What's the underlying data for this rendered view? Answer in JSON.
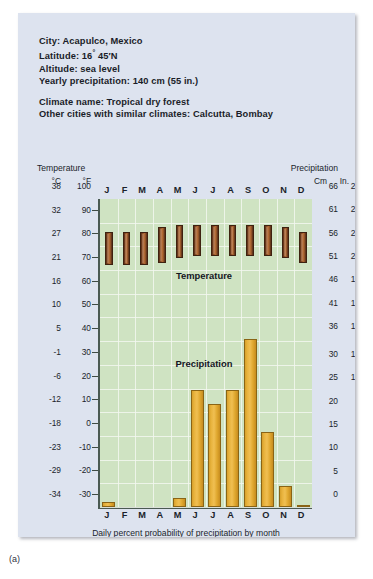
{
  "figure_label": "(a)",
  "header": {
    "city_line": "City: Acapulco, Mexico",
    "latitude_label": "Latitude: 16",
    "latitude_deg": "°",
    "latitude_rest": " 45′N",
    "altitude_line": "Altitude: sea level",
    "precip_line": "Yearly precipitation: 140 cm (55 in.)",
    "climate_line": "Climate name: Tropical dry forest",
    "similar_line": "Other cities with similar climates: Calcutta, Bombay"
  },
  "axes": {
    "left_caption": "Temperature",
    "left_unit_c": "°C",
    "left_unit_f": "°F",
    "right_caption": "Precipitation",
    "right_unit_cm": "Cm",
    "right_unit_in": "In."
  },
  "footer": {
    "caption": "Daily percent probability of precipitation by month"
  },
  "series_labels": {
    "temperature": "Temperature",
    "precipitation": "Precipitation"
  },
  "colors": {
    "card_bg": "#dde3ef",
    "plot_bg": "#cfe3c2",
    "temperature_bar": "#9d5a2c",
    "precipitation_bar": "#e8b33d",
    "axis": "#4a5a52",
    "text": "#1b1f2b"
  },
  "chart_data": {
    "type": "bar",
    "xlabel": "",
    "ylabel": "Temperature / Precipitation",
    "categories": [
      "J",
      "F",
      "M",
      "A",
      "M",
      "J",
      "J",
      "A",
      "S",
      "O",
      "N",
      "D"
    ],
    "month_names": [
      "January",
      "February",
      "March",
      "April",
      "May",
      "June",
      "July",
      "August",
      "September",
      "October",
      "November",
      "December"
    ],
    "left_axis": {
      "name": "Temperature",
      "unit_primary": "°C",
      "unit_secondary": "°F",
      "ticks_c": [
        38,
        32,
        27,
        21,
        16,
        10,
        5,
        -1,
        -6,
        -12,
        -18,
        -23,
        -29,
        -34
      ],
      "ticks_f": [
        100,
        90,
        80,
        70,
        60,
        50,
        40,
        30,
        20,
        10,
        0,
        -10,
        -20,
        -30
      ],
      "ylim_f": [
        -30,
        100
      ]
    },
    "right_axis": {
      "name": "Precipitation",
      "unit_primary": "Cm",
      "unit_secondary": "In.",
      "ticks_cm": [
        66,
        61,
        56,
        51,
        46,
        41,
        36,
        30,
        25,
        20,
        15,
        10,
        5,
        0
      ],
      "ticks_in": [
        26,
        24,
        22,
        20,
        18,
        16,
        14,
        12,
        10,
        8,
        6,
        4,
        2,
        0
      ],
      "ylim_cm": [
        0,
        66
      ]
    },
    "series": [
      {
        "name": "Temperature",
        "kind": "range-bar",
        "unit": "°F",
        "low_f": [
          72,
          72,
          72,
          73,
          75,
          76,
          76,
          76,
          76,
          76,
          75,
          73
        ],
        "high_f": [
          86,
          86,
          86,
          88,
          89,
          89,
          89,
          89,
          89,
          89,
          88,
          86
        ]
      },
      {
        "name": "Precipitation",
        "kind": "bar",
        "unit": "cm",
        "values_cm": [
          1,
          0,
          0,
          0,
          2,
          25,
          22,
          25,
          36,
          16,
          4.5,
          0.5
        ]
      }
    ],
    "daily_percent_probability": [
      26,
      39,
      16,
      20,
      19,
      7,
      6,
      10,
      20,
      29,
      27,
      29
    ]
  }
}
